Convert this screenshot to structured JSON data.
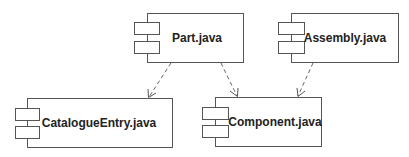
{
  "diagram": {
    "type": "UML component diagram",
    "components": [
      {
        "id": "part",
        "label": "Part.java"
      },
      {
        "id": "assembly",
        "label": "Assembly.java"
      },
      {
        "id": "catalogue",
        "label": "CatalogueEntry.java"
      },
      {
        "id": "component",
        "label": "Component.java"
      }
    ],
    "dependencies": [
      {
        "from": "Part.java",
        "to": "CatalogueEntry.java",
        "style": "dashed"
      },
      {
        "from": "Part.java",
        "to": "Component.java",
        "style": "dashed"
      },
      {
        "from": "Assembly.java",
        "to": "Component.java",
        "style": "dashed"
      }
    ]
  }
}
